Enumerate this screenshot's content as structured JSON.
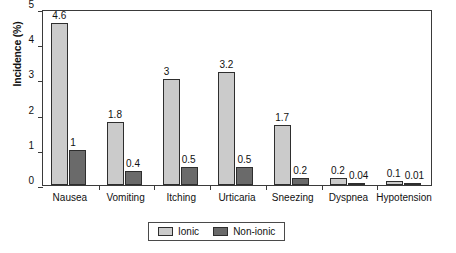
{
  "chart_data": {
    "type": "bar",
    "title": "",
    "xlabel": "",
    "ylabel": "Incidence (%)",
    "ylim": [
      0,
      5
    ],
    "yticks": [
      "0",
      "1",
      "2",
      "3",
      "4",
      "5"
    ],
    "grid": false,
    "legend_position": "bottom-center",
    "categories": [
      "Nausea",
      "Vomiting",
      "Itching",
      "Urticaria",
      "Sneezing",
      "Dyspnea",
      "Hypotension"
    ],
    "series": [
      {
        "name": "Ionic",
        "color": "#cbcbcb",
        "values": [
          4.6,
          1.8,
          3,
          3.2,
          1.7,
          0.2,
          0.1
        ],
        "labels": [
          "4.6",
          "1.8",
          "3",
          "3.2",
          "1.7",
          "0.2",
          "0.1"
        ]
      },
      {
        "name": "Non-ionic",
        "color": "#6a6a6a",
        "values": [
          1,
          0.4,
          0.5,
          0.5,
          0.2,
          0.04,
          0.01
        ],
        "labels": [
          "1",
          "0.4",
          "0.5",
          "0.5",
          "0.2",
          "0.04",
          "0.01"
        ]
      }
    ]
  },
  "axis": {
    "line_color": "#3a3a3a"
  }
}
